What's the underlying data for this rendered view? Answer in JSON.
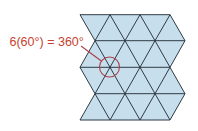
{
  "diagram": {
    "type": "triangular-tessellation",
    "annotation": {
      "text": "6(60°) = 360°",
      "color": "#c8412f"
    },
    "colors": {
      "fill": "#c7dfed",
      "stroke": "#2f3a44",
      "highlight": "#a8404a"
    },
    "rows": 4,
    "vertex_angle_degrees": 60,
    "triangles_at_vertex": 6,
    "sum_degrees": 360
  }
}
